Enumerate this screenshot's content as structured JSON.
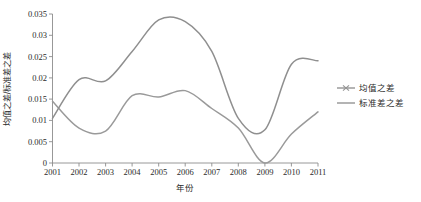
{
  "chart_data": {
    "type": "line",
    "title": "",
    "xlabel": "年份",
    "ylabel": "均值之差/标准差之差",
    "x": [
      2001,
      2002,
      2003,
      2004,
      2005,
      2006,
      2007,
      2008,
      2009,
      2010,
      2011
    ],
    "xlim": [
      2001,
      2011
    ],
    "ylim": [
      0,
      0.035
    ],
    "grid": false,
    "legend_position": "right",
    "xticklabels": [
      "2001",
      "2002",
      "2003",
      "2004",
      "2005",
      "2006",
      "2007",
      "2008",
      "2009",
      "2010",
      "2011"
    ],
    "yticklabels": [
      "0",
      "0.005",
      "0.01",
      "0.015",
      "0.02",
      "0.025",
      "0.03",
      "0.035"
    ],
    "yticks": [
      0,
      0.005,
      0.01,
      0.015,
      0.02,
      0.025,
      0.03,
      0.035
    ],
    "series": [
      {
        "name": "均值之差",
        "color": "#9a9a9a",
        "marker": "cross",
        "values": [
          0.0145,
          0.0082,
          0.0075,
          0.0158,
          0.0155,
          0.017,
          0.0128,
          0.0082,
          0.0,
          0.0068,
          0.012
        ]
      },
      {
        "name": "标准差之差",
        "color": "#8f8f8f",
        "marker": "none",
        "values": [
          0.0105,
          0.0196,
          0.0193,
          0.0262,
          0.0336,
          0.0332,
          0.0262,
          0.0105,
          0.0078,
          0.0232,
          0.024
        ]
      }
    ]
  },
  "legend": {
    "items": [
      {
        "label": "均值之差",
        "marker": "cross-line-marker"
      },
      {
        "label": "标准差之差",
        "marker": "plain-line-marker"
      }
    ]
  },
  "axes": {
    "x_title": "年份",
    "y_title": "均值之差/标准差之差"
  },
  "colors": {
    "line": "#949494",
    "axis": "#8c8c8c",
    "text": "#2b2b2b",
    "background": "#ffffff"
  }
}
